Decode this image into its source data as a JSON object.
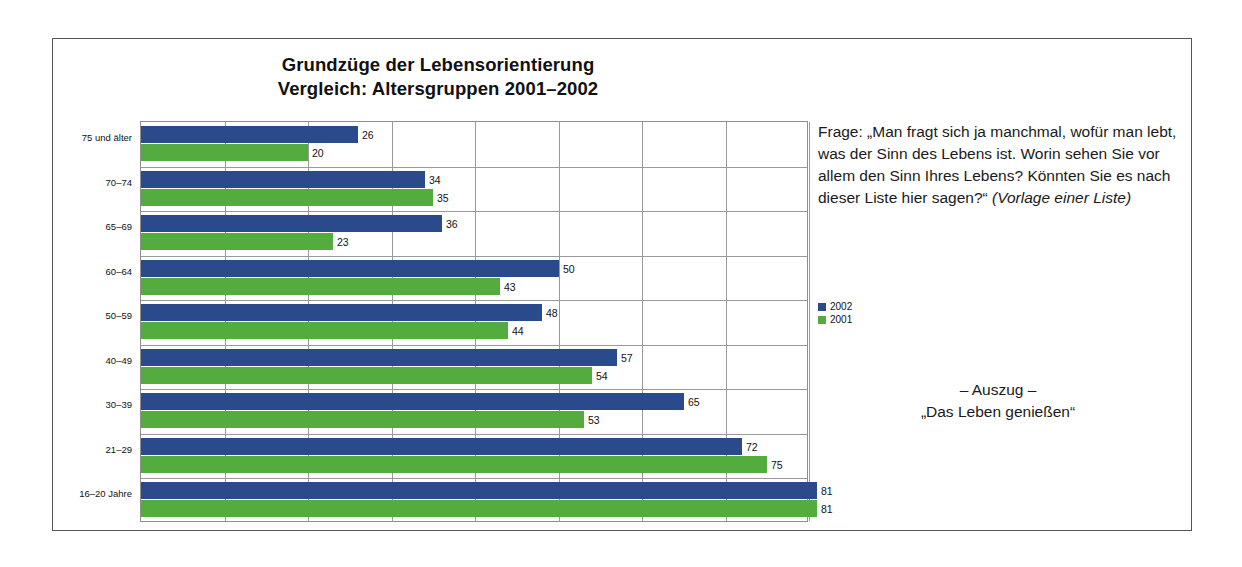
{
  "title": {
    "line1": "Grundzüge der Lebensorientierung",
    "line2": "Vergleich: Altersgruppen 2001–2002"
  },
  "question": {
    "body": "Frage: „Man fragt sich ja manchmal, wofür man lebt, was der Sinn des Lebens ist. Worin sehen Sie vor allem den Sinn Ihres Lebens? Könnten Sie es nach dieser Liste hier sagen?“ ",
    "note": "(Vorlage einer Liste)"
  },
  "legend": {
    "items": [
      {
        "label": "2002",
        "color": "#2b4a8b"
      },
      {
        "label": "2001",
        "color": "#54ab3e"
      }
    ]
  },
  "caption": {
    "line1": "– Auszug –",
    "line2": "„Das Leben genießen“"
  },
  "chart_data": {
    "type": "bar",
    "orientation": "horizontal",
    "title": "Grundzüge der Lebensorientierung\nVergleich: Altersgruppen 2001–2002",
    "xlabel": "",
    "ylabel": "",
    "xlim": [
      0,
      80
    ],
    "grid": true,
    "gridlines_x": [
      0,
      10,
      20,
      30,
      40,
      50,
      60,
      70,
      80
    ],
    "legend_position": "right",
    "categories": [
      "75 und älter",
      "70–74",
      "65–69",
      "60–64",
      "50–59",
      "40–49",
      "30–39",
      "21–29",
      "16–20 Jahre"
    ],
    "series": [
      {
        "name": "2002",
        "color": "#2b4a8b",
        "values": [
          26,
          34,
          36,
          50,
          48,
          57,
          65,
          72,
          81
        ]
      },
      {
        "name": "2001",
        "color": "#54ab3e",
        "values": [
          20,
          35,
          23,
          43,
          44,
          54,
          53,
          75,
          81
        ]
      }
    ]
  }
}
